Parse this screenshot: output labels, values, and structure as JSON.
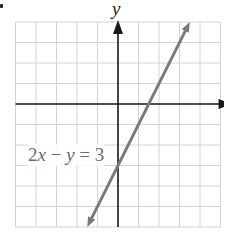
{
  "chart_data": {
    "type": "line",
    "title": "",
    "xlabel": "",
    "ylabel": "y",
    "xlim": [
      -5,
      5
    ],
    "ylim": [
      -6,
      4
    ],
    "grid": true,
    "grid_step": 1,
    "legend": "none",
    "series": [
      {
        "name": "2x − y = 3",
        "equation": "2x - y = 3",
        "slope": 2,
        "y_intercept": -3,
        "x_intercept": 1.5,
        "x": [
          -1.5,
          0,
          1.5,
          3.5
        ],
        "y": [
          -6,
          -3,
          0,
          4
        ],
        "arrows": "both"
      }
    ],
    "annotations": [
      {
        "text": "2x − y = 3",
        "x": -4.5,
        "y": -2.5
      }
    ]
  },
  "labels": {
    "y_axis": "y",
    "equation_left": "2",
    "equation_x": "x",
    "equation_mid": " − ",
    "equation_y": "y",
    "equation_right": " = 3"
  },
  "colors": {
    "grid": "#d4d4d4",
    "axes": "#1a1a1a",
    "line": "#7a7a7a",
    "equation_text": "#6b6b6b"
  }
}
